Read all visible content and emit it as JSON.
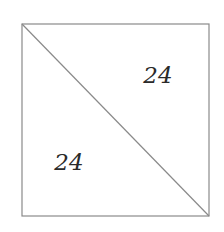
{
  "diagram": {
    "shape": "square",
    "divided_by": "diagonal from top-left to bottom-right",
    "regions": [
      {
        "name": "upper-right-triangle",
        "label": "24"
      },
      {
        "name": "lower-left-triangle",
        "label": "24"
      }
    ],
    "colors": {
      "stroke": "#8a8a8a",
      "text": "#2a2a2a",
      "background": "#ffffff"
    }
  }
}
